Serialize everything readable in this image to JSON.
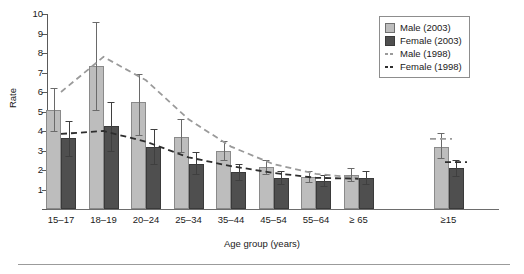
{
  "chart_data": {
    "type": "bar",
    "title": "",
    "xlabel": "Age group (years)",
    "ylabel": "Rate",
    "ylim": [
      0,
      10
    ],
    "yticks": [
      0,
      1,
      2,
      3,
      4,
      5,
      6,
      7,
      8,
      9,
      10
    ],
    "grid": false,
    "legend_position": "top-right",
    "categories": [
      "15–17",
      "18–19",
      "20–24",
      "25–34",
      "35–44",
      "45–54",
      "55–64",
      "≥ 65",
      "≥15"
    ],
    "series": [
      {
        "name": "Male (2003)",
        "type": "bar",
        "color": "#bdbdbd",
        "values": [
          5.1,
          7.35,
          5.5,
          3.7,
          3.0,
          2.15,
          1.65,
          1.75,
          3.2
        ],
        "ci_low": [
          4.0,
          5.1,
          3.8,
          2.9,
          2.5,
          1.8,
          1.4,
          1.45,
          2.6
        ],
        "ci_high": [
          6.2,
          9.6,
          6.9,
          4.6,
          3.5,
          2.5,
          1.95,
          2.1,
          3.9
        ]
      },
      {
        "name": "Female (2003)",
        "type": "bar",
        "color": "#4f4f4f",
        "values": [
          3.65,
          4.25,
          3.2,
          2.3,
          1.9,
          1.6,
          1.45,
          1.6,
          2.1
        ],
        "ci_low": [
          2.7,
          3.0,
          2.3,
          1.8,
          1.5,
          1.3,
          1.2,
          1.3,
          1.7
        ],
        "ci_high": [
          4.5,
          5.5,
          4.1,
          2.9,
          2.3,
          1.95,
          1.75,
          1.95,
          2.5
        ]
      },
      {
        "name": "Male (1998)",
        "type": "line",
        "style": "dashed",
        "color": "#9a9a9a",
        "values": [
          6.0,
          7.8,
          6.6,
          4.6,
          3.2,
          2.3,
          1.8,
          1.6,
          3.6
        ]
      },
      {
        "name": "Female (1998)",
        "type": "line",
        "style": "dashed",
        "color": "#2e2e2e",
        "values": [
          3.85,
          4.0,
          3.45,
          2.65,
          2.2,
          1.85,
          1.6,
          1.55,
          2.4
        ]
      }
    ]
  },
  "legend": {
    "items": [
      {
        "label": "Male (2003)",
        "marker": "light-gray-square"
      },
      {
        "label": "Female (2003)",
        "marker": "dark-gray-square"
      },
      {
        "label": "Male (1998)",
        "marker": "light-gray-dashed-line"
      },
      {
        "label": "Female (1998)",
        "marker": "dark-gray-dashed-line"
      }
    ]
  }
}
